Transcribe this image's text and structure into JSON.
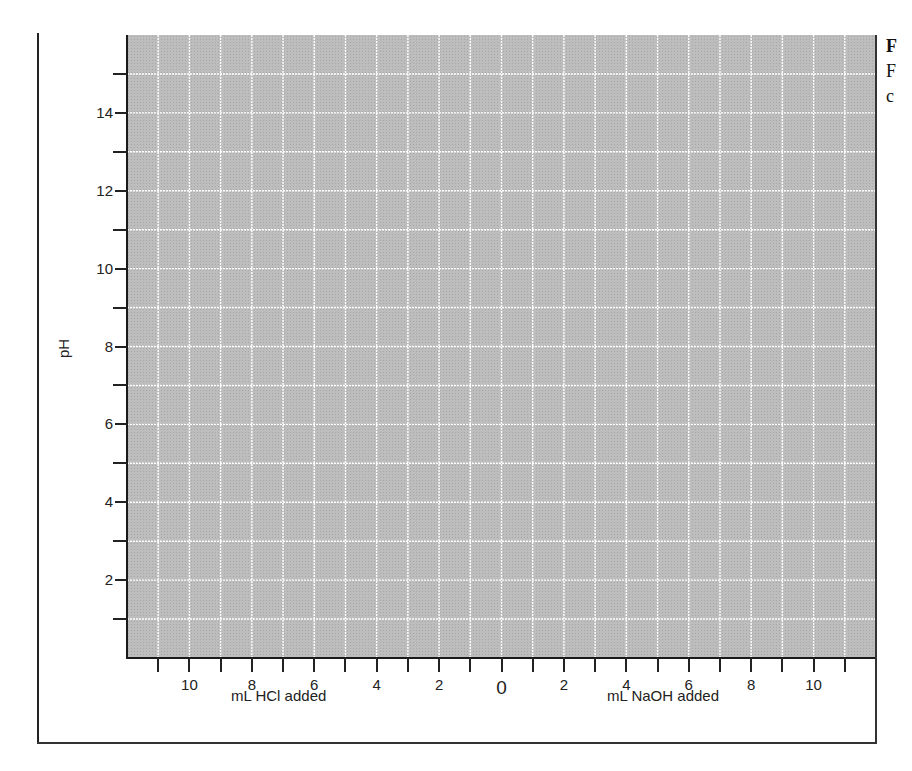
{
  "chart_data": {
    "type": "line",
    "title": "",
    "xlabel_left": "mL HCl added",
    "xlabel_right": "mL NaOH added",
    "ylabel": "pH",
    "x_ticks_left": [
      "10",
      "8",
      "6",
      "4",
      "2"
    ],
    "x_tick_zero": "0",
    "x_ticks_right": [
      "2",
      "4",
      "6",
      "8",
      "10"
    ],
    "y_ticks": [
      "14",
      "12",
      "10",
      "8",
      "6",
      "4",
      "2"
    ],
    "xlim": [
      -12,
      12
    ],
    "ylim": [
      0,
      16
    ],
    "x_minor_step": 1,
    "y_minor_step": 1,
    "grid": true,
    "series": []
  },
  "axes": {
    "y_label": "pH",
    "x_label_left": "mL HCl added",
    "x_label_right": "mL NaOH added"
  },
  "caption": {
    "line1": "F",
    "line2": "F",
    "line3": "c"
  },
  "colors": {
    "plot_fill": "#bdbdbd",
    "grid_line": "#ffffff",
    "axis": "#1a1a1a"
  }
}
